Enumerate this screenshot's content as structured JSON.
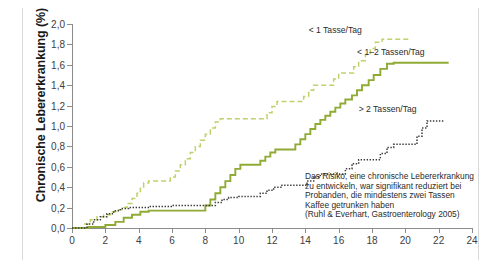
{
  "chart_data": {
    "type": "line",
    "title": "",
    "xlabel": "",
    "ylabel": "Chronische Lebererkrankung (%)",
    "xlim": [
      0,
      24
    ],
    "ylim": [
      0,
      2.0
    ],
    "grid": false,
    "legend_position": "inline-annotations",
    "x_ticks": [
      "0",
      "2",
      "4",
      "6",
      "8",
      "10",
      "12",
      "14",
      "16",
      "18",
      "20",
      "22",
      "24"
    ],
    "x_tick_values": [
      0,
      2,
      4,
      6,
      8,
      10,
      12,
      14,
      16,
      18,
      20,
      22,
      24
    ],
    "y_ticks": [
      "0,0",
      "0,2",
      "0,4",
      "0,6",
      "0,8",
      "1,0",
      "1,2",
      "1,4",
      "1,6",
      "1,8",
      "2,0"
    ],
    "y_tick_values": [
      0,
      0.2,
      0.4,
      0.6,
      0.8,
      1.0,
      1.2,
      1.4,
      1.6,
      1.8,
      2.0
    ],
    "series": [
      {
        "name": "< 1 Tasse/Tag",
        "color": "#c3cf6a",
        "style": "dashed",
        "label_x": 14.2,
        "label_y": 1.93,
        "points": [
          [
            0.0,
            0.0
          ],
          [
            0.7,
            0.04
          ],
          [
            1.1,
            0.08
          ],
          [
            1.5,
            0.11
          ],
          [
            1.9,
            0.13
          ],
          [
            2.3,
            0.16
          ],
          [
            2.7,
            0.18
          ],
          [
            3.0,
            0.2
          ],
          [
            3.3,
            0.24
          ],
          [
            3.6,
            0.29
          ],
          [
            3.9,
            0.34
          ],
          [
            4.1,
            0.39
          ],
          [
            4.3,
            0.44
          ],
          [
            4.6,
            0.46
          ],
          [
            5.6,
            0.46
          ],
          [
            5.9,
            0.5
          ],
          [
            6.2,
            0.56
          ],
          [
            6.5,
            0.62
          ],
          [
            6.8,
            0.68
          ],
          [
            7.1,
            0.74
          ],
          [
            7.4,
            0.8
          ],
          [
            7.7,
            0.86
          ],
          [
            8.0,
            0.92
          ],
          [
            8.3,
            0.98
          ],
          [
            8.6,
            1.04
          ],
          [
            8.9,
            1.07
          ],
          [
            11.4,
            1.07
          ],
          [
            11.7,
            1.13
          ],
          [
            12.0,
            1.19
          ],
          [
            12.3,
            1.24
          ],
          [
            13.6,
            1.24
          ],
          [
            13.9,
            1.29
          ],
          [
            14.2,
            1.35
          ],
          [
            14.5,
            1.4
          ],
          [
            15.4,
            1.4
          ],
          [
            15.7,
            1.46
          ],
          [
            16.0,
            1.52
          ],
          [
            16.6,
            1.52
          ],
          [
            16.9,
            1.58
          ],
          [
            17.2,
            1.64
          ],
          [
            17.6,
            1.7
          ],
          [
            17.9,
            1.76
          ],
          [
            18.2,
            1.82
          ],
          [
            18.6,
            1.85
          ],
          [
            20.3,
            1.85
          ]
        ]
      },
      {
        "name": "< 1–2 Tassen/Tag",
        "color": "#8faa35",
        "style": "solid",
        "label_x": 17.1,
        "label_y": 1.72,
        "points": [
          [
            0.0,
            0.0
          ],
          [
            1.0,
            0.01
          ],
          [
            2.0,
            0.03
          ],
          [
            2.6,
            0.06
          ],
          [
            3.1,
            0.1
          ],
          [
            3.6,
            0.13
          ],
          [
            4.1,
            0.16
          ],
          [
            4.6,
            0.17
          ],
          [
            7.7,
            0.17
          ],
          [
            8.0,
            0.22
          ],
          [
            8.3,
            0.28
          ],
          [
            8.6,
            0.34
          ],
          [
            8.9,
            0.4
          ],
          [
            9.2,
            0.46
          ],
          [
            9.5,
            0.52
          ],
          [
            9.8,
            0.58
          ],
          [
            10.1,
            0.62
          ],
          [
            11.0,
            0.62
          ],
          [
            11.3,
            0.66
          ],
          [
            11.6,
            0.7
          ],
          [
            11.9,
            0.74
          ],
          [
            12.2,
            0.77
          ],
          [
            13.1,
            0.77
          ],
          [
            13.4,
            0.82
          ],
          [
            13.7,
            0.87
          ],
          [
            14.0,
            0.92
          ],
          [
            14.3,
            0.97
          ],
          [
            14.6,
            1.02
          ],
          [
            14.9,
            1.06
          ],
          [
            15.2,
            1.1
          ],
          [
            15.5,
            1.14
          ],
          [
            15.8,
            1.18
          ],
          [
            16.1,
            1.22
          ],
          [
            16.4,
            1.26
          ],
          [
            16.8,
            1.3
          ],
          [
            17.1,
            1.35
          ],
          [
            17.4,
            1.4
          ],
          [
            17.8,
            1.45
          ],
          [
            18.1,
            1.5
          ],
          [
            18.5,
            1.56
          ],
          [
            18.9,
            1.61
          ],
          [
            19.3,
            1.62
          ],
          [
            22.6,
            1.62
          ]
        ]
      },
      {
        "name": "> 2 Tassen/Tag",
        "color": "#3a3a3a",
        "style": "dotted",
        "label_x": 17.2,
        "label_y": 1.16,
        "points": [
          [
            0.0,
            0.0
          ],
          [
            0.9,
            0.04
          ],
          [
            1.3,
            0.08
          ],
          [
            1.7,
            0.11
          ],
          [
            2.1,
            0.14
          ],
          [
            2.5,
            0.17
          ],
          [
            2.9,
            0.19
          ],
          [
            3.4,
            0.2
          ],
          [
            4.3,
            0.2
          ],
          [
            4.7,
            0.21
          ],
          [
            5.6,
            0.21
          ],
          [
            6.0,
            0.22
          ],
          [
            8.2,
            0.22
          ],
          [
            8.6,
            0.25
          ],
          [
            9.0,
            0.28
          ],
          [
            9.4,
            0.3
          ],
          [
            10.0,
            0.31
          ],
          [
            10.9,
            0.31
          ],
          [
            11.3,
            0.34
          ],
          [
            11.7,
            0.37
          ],
          [
            12.1,
            0.4
          ],
          [
            12.6,
            0.42
          ],
          [
            13.7,
            0.42
          ],
          [
            14.1,
            0.46
          ],
          [
            14.5,
            0.5
          ],
          [
            14.9,
            0.53
          ],
          [
            16.0,
            0.53
          ],
          [
            16.4,
            0.58
          ],
          [
            16.8,
            0.63
          ],
          [
            17.2,
            0.67
          ],
          [
            18.1,
            0.67
          ],
          [
            18.5,
            0.73
          ],
          [
            18.9,
            0.79
          ],
          [
            19.3,
            0.82
          ],
          [
            20.3,
            0.82
          ],
          [
            20.7,
            0.9
          ],
          [
            21.0,
            0.98
          ],
          [
            21.3,
            1.05
          ],
          [
            22.3,
            1.05
          ]
        ]
      }
    ],
    "annotation": {
      "lines": [
        "Das Risiko, eine chronische Lebererkrankung",
        "zu entwickeln, war signifikant reduziert bei",
        "Probanden, die mindestens zwei Tassen",
        "Kaffee getrunken haben",
        "(Ruhl & Everhart, Gastroenterology 2005)"
      ]
    }
  }
}
